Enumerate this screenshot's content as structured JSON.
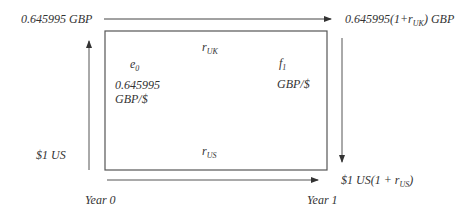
{
  "diagram": {
    "top_left": "0.645995 GBP",
    "top_right_pre": "0.645995(1+r",
    "top_right_sub": "UK",
    "top_right_post": ") GBP",
    "left": "$1 US",
    "bottom_right_pre": "$1 US(1 + r",
    "bottom_right_sub": "US",
    "bottom_right_post": ")",
    "year0": "Year 0",
    "year1": "Year 1",
    "box": {
      "e0_main": "e",
      "e0_sub": "0",
      "e0_value": "0.645995",
      "e0_unit": "GBP/$",
      "r_uk_main": "r",
      "r_uk_sub": "UK",
      "r_us_main": "r",
      "r_us_sub": "US",
      "f1_main": "f",
      "f1_sub": "1",
      "f1_unit": "GBP/$"
    },
    "colors": {
      "line": "#555555",
      "text": "#333333"
    }
  }
}
